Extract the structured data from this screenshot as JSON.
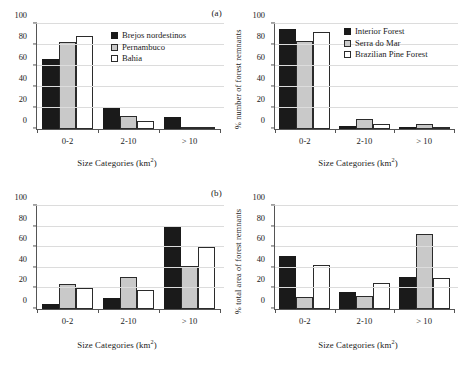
{
  "figure": {
    "panel_labels": {
      "top": "(a)",
      "bottom": "(b)"
    },
    "axis": {
      "xlabel_text": "Size Categories (km",
      "xlabel_sup": "2",
      "xlabel_close": ")",
      "categories": [
        "0-2",
        "2-10",
        "> 10"
      ],
      "yticks": [
        "0",
        "20",
        "40",
        "60",
        "80",
        "100"
      ],
      "ylim": [
        0,
        100
      ]
    }
  },
  "chart_data": [
    {
      "id": "panel-a-left",
      "type": "bar",
      "title": "(a)",
      "xlabel": "Size Categories (km2)",
      "ylabel": "",
      "categories": [
        "0-2",
        "2-10",
        "> 10"
      ],
      "ylim": [
        0,
        100
      ],
      "yticks": [
        0,
        20,
        40,
        60,
        80,
        100
      ],
      "grid": true,
      "legend_position": "top-right",
      "series": [
        {
          "name": "Brejos nordestinos",
          "color": "#1a1a1a",
          "values": [
            67,
            20,
            11
          ]
        },
        {
          "name": "Pernambuco",
          "color": "#c9c9c9",
          "values": [
            83,
            12.5,
            2
          ]
        },
        {
          "name": "Bahia",
          "color": "#ffffff",
          "values": [
            89,
            8,
            1.5
          ]
        }
      ]
    },
    {
      "id": "panel-a-right",
      "type": "bar",
      "title": "",
      "xlabel": "Size Categories (km2)",
      "ylabel": "% number of forest remnants",
      "categories": [
        "0-2",
        "2-10",
        "> 10"
      ],
      "ylim": [
        0,
        100
      ],
      "yticks": [
        0,
        20,
        40,
        60,
        80,
        100
      ],
      "grid": true,
      "legend_position": "top-right",
      "series": [
        {
          "name": "Interior Forest",
          "color": "#1a1a1a",
          "values": [
            95,
            3,
            0.5
          ]
        },
        {
          "name": "Serra do Mar",
          "color": "#c9c9c9",
          "values": [
            84,
            9.5,
            4.5
          ]
        },
        {
          "name": "Brazilian Pine Forest",
          "color": "#ffffff",
          "values": [
            92,
            5,
            1
          ]
        }
      ]
    },
    {
      "id": "panel-b-left",
      "type": "bar",
      "title": "(b)",
      "xlabel": "Size Categories (km2)",
      "ylabel": "",
      "categories": [
        "0-2",
        "2-10",
        "> 10"
      ],
      "ylim": [
        0,
        100
      ],
      "yticks": [
        0,
        20,
        40,
        60,
        80,
        100
      ],
      "grid": true,
      "legend_position": "none",
      "series": [
        {
          "name": "Brejos nordestinos",
          "color": "#1a1a1a",
          "values": [
            5,
            11,
            81
          ]
        },
        {
          "name": "Pernambuco",
          "color": "#c9c9c9",
          "values": [
            24,
            31,
            42
          ]
        },
        {
          "name": "Bahia",
          "color": "#ffffff",
          "values": [
            20,
            18,
            60
          ]
        }
      ]
    },
    {
      "id": "panel-b-right",
      "type": "bar",
      "title": "",
      "xlabel": "Size Categories (km2)",
      "ylabel": "% total area of forest remnants",
      "categories": [
        "0-2",
        "2-10",
        "> 10"
      ],
      "ylim": [
        0,
        100
      ],
      "yticks": [
        0,
        20,
        40,
        60,
        80,
        100
      ],
      "grid": true,
      "legend_position": "none",
      "series": [
        {
          "name": "Interior Forest",
          "color": "#1a1a1a",
          "values": [
            51,
            17,
            31
          ]
        },
        {
          "name": "Serra do Mar",
          "color": "#c9c9c9",
          "values": [
            12,
            13,
            73
          ]
        },
        {
          "name": "Brazilian Pine Forest",
          "color": "#ffffff",
          "values": [
            43,
            25,
            30
          ]
        }
      ]
    }
  ],
  "legends": {
    "left": {
      "items": [
        {
          "label": "Brejos nordestinos",
          "swatch": "black-square-swatch"
        },
        {
          "label": "Pernambuco",
          "swatch": "gray-square-swatch"
        },
        {
          "label": "Bahia",
          "swatch": "white-square-swatch"
        }
      ]
    },
    "right": {
      "items": [
        {
          "label": "Interior Forest",
          "swatch": "black-square-swatch"
        },
        {
          "label": "Serra do Mar",
          "swatch": "gray-square-swatch"
        },
        {
          "label": "Brazilian Pine Forest",
          "swatch": "white-square-swatch"
        }
      ]
    }
  }
}
